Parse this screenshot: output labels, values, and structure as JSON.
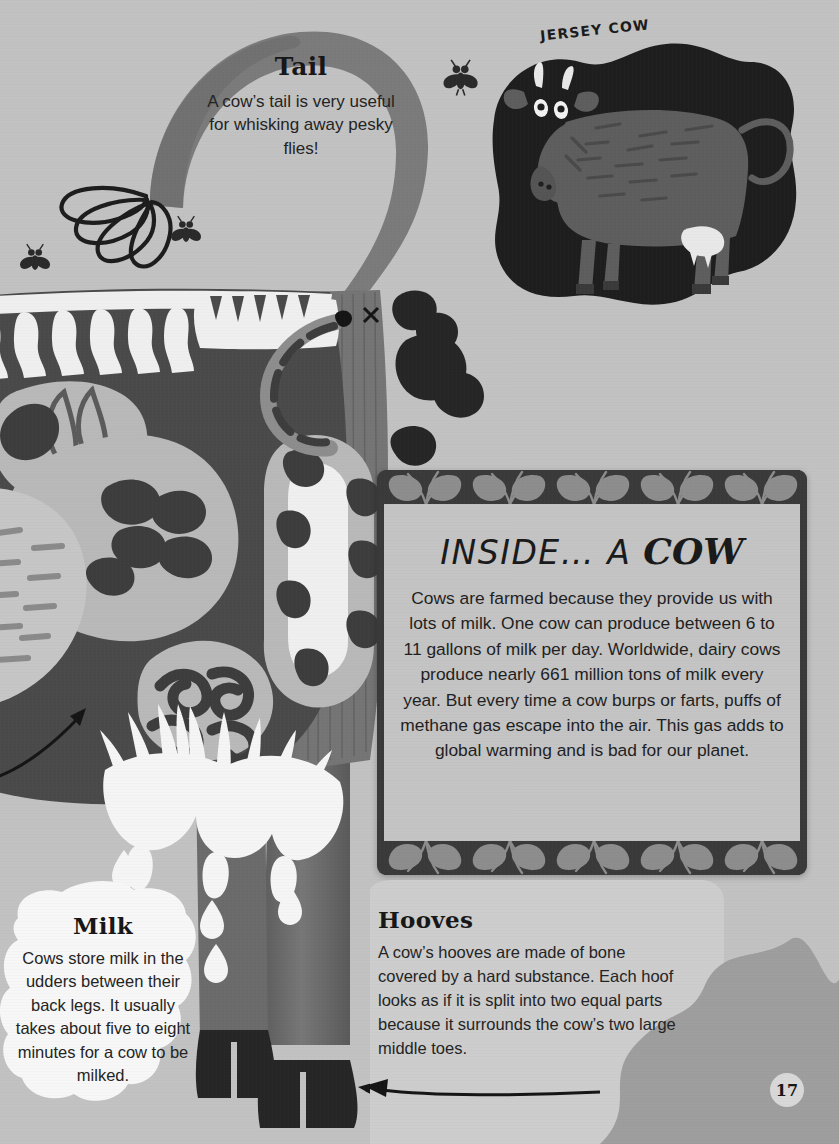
{
  "page": {
    "number": "17",
    "background_color": "#c2c2c2"
  },
  "colors": {
    "paper": "#c2c2c2",
    "body_mid": "#6e6e6e",
    "body_dark": "#4a4a4a",
    "body_darker": "#3a3a3a",
    "organ_light": "#b9b9b9",
    "organ_pale": "#d2d2d2",
    "bone_white": "#f0f0f0",
    "ink_black": "#1a1a1a",
    "blob_dark": "#9e9e9e",
    "milk_white": "#f5f5f5",
    "panel_frame": "#3a3a3a",
    "panel_fill": "#c4c4c4"
  },
  "jersey_cow": {
    "label": "JERSEY COW"
  },
  "tail": {
    "heading": "Tail",
    "body": "A cow’s tail is very useful for whisking away pesky flies!"
  },
  "milk": {
    "heading": "Milk",
    "body": "Cows store milk in the udders between their back legs. It usually takes about five to eight minutes for a cow to be milked."
  },
  "hooves": {
    "heading": "Hooves",
    "body": "A cow’s hooves are made of bone covered by a hard substance. Each hoof looks as if it is split into two equal parts because it surrounds the cow’s two large middle toes."
  },
  "info_panel": {
    "title_plain": "INSIDE… A ",
    "title_script": "COW",
    "body": "Cows are farmed because they provide us with lots of milk. One cow can produce between 6 to 11 gallons of milk per day. Worldwide, dairy cows produce nearly 661 million tons of milk every year. But every time a cow burps or farts, puffs of methane gas escape into the air. This gas adds to global warming and is bad for our planet."
  },
  "illustration": {
    "icons": [
      "fly-icon",
      "fly-icon",
      "fly-icon",
      "cow-tail-tuft-icon",
      "udder-icon",
      "milk-drop-icon",
      "hoof-icon",
      "arrow-icon",
      "spine-icon",
      "rib-icon",
      "stomach-icon",
      "intestine-icon",
      "heart-icon",
      "lung-icon",
      "grass-blob-icon"
    ]
  }
}
